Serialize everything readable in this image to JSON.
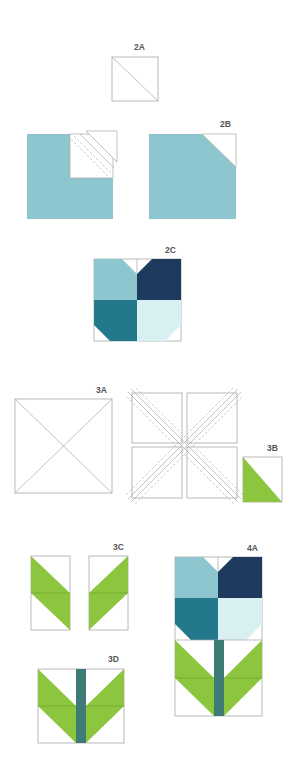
{
  "colors": {
    "light_blue": "#8ec6cf",
    "navy": "#1e3a5e",
    "teal": "#23788b",
    "pale_aqua": "#d9f0f3",
    "green": "#8cc63f",
    "stem": "#3e7b77",
    "white": "#ffffff",
    "outline": "#a8a8a8",
    "label": "#555555"
  },
  "figures": [
    {
      "id": "2A",
      "label": "2A",
      "description": "Square with one diagonal line"
    },
    {
      "id": "2B",
      "label": "2B",
      "description": "Light blue square with white top-right corner triangle; left shows stitch-and-flip corner square"
    },
    {
      "id": "2C",
      "label": "2C",
      "description": "Four-patch flower block: light blue, navy, teal, pale aqua with corner cuts"
    },
    {
      "id": "3A",
      "label": "3A",
      "description": "Square with both diagonals"
    },
    {
      "id": "3B",
      "label": "3B",
      "description": "Half-square triangle, green lower-left"
    },
    {
      "id": "3C",
      "label": "3C",
      "description": "Two mirrored leaf units, each two green half-square triangles"
    },
    {
      "id": "3D",
      "label": "3D",
      "description": "Leaf units joined with center stem strip"
    },
    {
      "id": "4A",
      "label": "4A",
      "description": "Completed tulip block: flower four-patch over stem-and-leaves unit"
    }
  ]
}
